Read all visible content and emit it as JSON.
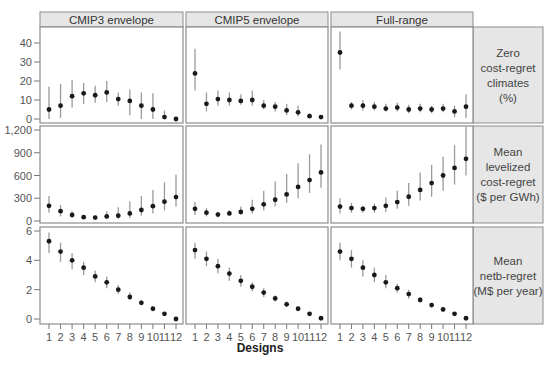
{
  "chart_data": {
    "type": "scatter",
    "subtype": "point-range (mean with uncertainty bars), faceted grid 3x3",
    "xlabel": "Designs",
    "x": [
      1,
      2,
      3,
      4,
      5,
      6,
      7,
      8,
      9,
      10,
      11,
      12
    ],
    "x_tick_labels": [
      "1",
      "2",
      "3",
      "4",
      "5",
      "6",
      "7",
      "8",
      "9",
      "10",
      "11",
      "12"
    ],
    "columns": [
      "CMIP3 envelope",
      "CMIP5 envelope",
      "Full-range"
    ],
    "rows": [
      {
        "label": "Zero cost-regret climates (%)",
        "label_lines": [
          "Zero",
          "cost-regret",
          "climates",
          "(%)"
        ],
        "ylim": [
          0,
          48
        ],
        "yticks": [
          0,
          10,
          20,
          30,
          40
        ],
        "ytick_labels": [
          "0",
          "10",
          "20",
          "30",
          "40"
        ],
        "panels": [
          {
            "column": "CMIP3 envelope",
            "mean": [
              5,
              7,
              12,
              13.5,
              12.5,
              14,
              10.5,
              9.5,
              7,
              5,
              1,
              0
            ],
            "low": [
              0,
              0.5,
              6,
              8,
              8.5,
              9,
              7,
              2,
              0,
              0,
              0,
              0
            ],
            "high": [
              17,
              18.5,
              20.5,
              19,
              17.5,
              20,
              14,
              15.5,
              14,
              13.5,
              4.5,
              1
            ]
          },
          {
            "column": "CMIP5 envelope",
            "mean": [
              24,
              8,
              10.5,
              10,
              9.5,
              10,
              7,
              6.5,
              4.5,
              3.5,
              1.5,
              1
            ],
            "low": [
              15,
              4,
              7,
              7,
              7.5,
              7,
              5,
              4,
              2,
              1.5,
              0.5,
              0
            ],
            "high": [
              37,
              14,
              15,
              14,
              13,
              15,
              10,
              9,
              8,
              7,
              3,
              2
            ]
          },
          {
            "column": "Full-range",
            "mean": [
              35,
              7,
              7,
              6.5,
              5.5,
              6,
              5,
              5.5,
              5,
              5.5,
              4,
              6.5
            ],
            "low": [
              26,
              5,
              4.5,
              4.5,
              4,
              4,
              3,
              3.5,
              3,
              3.5,
              1,
              0.5
            ],
            "high": [
              46,
              9,
              10,
              9,
              8,
              8.5,
              7.5,
              8,
              7,
              8,
              7,
              13
            ]
          }
        ]
      },
      {
        "label": "Mean levelized cost-regret ($ per GWh)",
        "label_lines": [
          "Mean",
          "levelized",
          "cost-regret",
          "($ per GWh)"
        ],
        "ylim": [
          0,
          1200
        ],
        "yticks": [
          0,
          300,
          600,
          900,
          1200
        ],
        "ytick_labels": [
          "0",
          "300",
          "600",
          "900",
          "1,200"
        ],
        "panels": [
          {
            "column": "CMIP3 envelope",
            "mean": [
              200,
              130,
              80,
              50,
              45,
              60,
              70,
              100,
              145,
              195,
              255,
              315
            ],
            "low": [
              110,
              60,
              40,
              25,
              25,
              25,
              30,
              40,
              70,
              100,
              140,
              190
            ],
            "high": [
              330,
              210,
              130,
              75,
              70,
              130,
              180,
              260,
              330,
              410,
              510,
              610
            ]
          },
          {
            "column": "CMIP5 envelope",
            "mean": [
              160,
              110,
              85,
              100,
              120,
              160,
              220,
              280,
              350,
              450,
              540,
              640
            ],
            "low": [
              80,
              60,
              50,
              70,
              80,
              100,
              140,
              190,
              240,
              300,
              370,
              440
            ],
            "high": [
              250,
              170,
              120,
              140,
              190,
              280,
              400,
              520,
              620,
              760,
              880,
              1010
            ]
          },
          {
            "column": "Full-range",
            "mean": [
              190,
              170,
              160,
              170,
              200,
              250,
              320,
              410,
              500,
              600,
              700,
              820
            ],
            "low": [
              100,
              110,
              110,
              110,
              120,
              160,
              200,
              270,
              320,
              400,
              480,
              600
            ],
            "high": [
              300,
              240,
              200,
              230,
              310,
              400,
              500,
              640,
              740,
              850,
              1000,
              1240
            ]
          }
        ]
      },
      {
        "label": "Mean netb-regret (M$ per year)",
        "label_lines": [
          "Mean",
          "netb-regret",
          "(M$ per year)"
        ],
        "ylim": [
          -0.3,
          6.2
        ],
        "yticks": [
          0,
          2,
          4,
          6
        ],
        "ytick_labels": [
          "0",
          "2",
          "4",
          "6"
        ],
        "panels": [
          {
            "column": "CMIP3 envelope",
            "mean": [
              5.3,
              4.6,
              4.0,
              3.5,
              2.9,
              2.5,
              2.0,
              1.5,
              1.1,
              0.7,
              0.35,
              0.0
            ],
            "low": [
              4.5,
              3.9,
              3.4,
              3.0,
              2.5,
              2.1,
              1.7,
              1.3,
              0.95,
              0.6,
              0.25,
              -0.05
            ],
            "high": [
              5.9,
              5.2,
              4.5,
              3.9,
              3.3,
              2.9,
              2.3,
              1.8,
              1.3,
              0.85,
              0.45,
              0.05
            ]
          },
          {
            "column": "CMIP5 envelope",
            "mean": [
              4.7,
              4.1,
              3.6,
              3.1,
              2.6,
              2.2,
              1.8,
              1.4,
              1.0,
              0.7,
              0.35,
              0.05
            ],
            "low": [
              4.1,
              3.6,
              3.1,
              2.6,
              2.2,
              1.9,
              1.5,
              1.2,
              0.85,
              0.55,
              0.25,
              0.0
            ],
            "high": [
              5.2,
              4.6,
              4.1,
              3.5,
              3.0,
              2.5,
              2.1,
              1.6,
              1.2,
              0.8,
              0.45,
              0.1
            ]
          },
          {
            "column": "Full-range",
            "mean": [
              4.6,
              4.1,
              3.5,
              3.0,
              2.5,
              2.1,
              1.7,
              1.3,
              0.95,
              0.65,
              0.35,
              0.05
            ],
            "low": [
              4.0,
              3.5,
              2.9,
              2.5,
              2.1,
              1.8,
              1.4,
              1.1,
              0.8,
              0.5,
              0.25,
              0.0
            ],
            "high": [
              5.2,
              4.7,
              4.0,
              3.5,
              3.0,
              2.4,
              2.0,
              1.5,
              1.1,
              0.75,
              0.45,
              0.1
            ]
          }
        ]
      }
    ],
    "grid": false,
    "legend": "none"
  },
  "colors": {
    "strip_fill": "#e6e6e6",
    "panel_border": "#8c8c8c",
    "point": "#1a1a1a",
    "error_bar": "#9a9a9a",
    "tick_text": "#555555",
    "axis_title": "#222222"
  }
}
